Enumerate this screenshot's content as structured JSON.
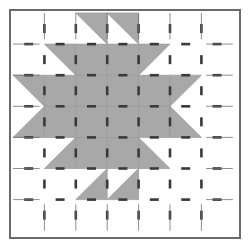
{
  "figure": {
    "title": "Quilt Block Pattern Diagram",
    "width": 250,
    "height": 248
  },
  "colors": {
    "background": "#ffffff",
    "patch_fill": "#a8a8a8",
    "patch_edge": "#9a9a9a",
    "frame_stroke": "#6b6b6b",
    "seam_dash": "#3a3a3a"
  },
  "grid": {
    "columns": 7,
    "rows": 7,
    "cell_width": 31.4,
    "cell_height": 31.1,
    "origin_x": 2,
    "origin_y": 2,
    "frame_inset": 9,
    "frame_border_width": 2
  },
  "seam_marks": {
    "dash_length": 9,
    "dash_thickness": 2.6,
    "note": "short dashed tick marks centered on each patch edge"
  },
  "patches": [
    {
      "row": 0,
      "col": 0,
      "shape": "empty"
    },
    {
      "row": 0,
      "col": 1,
      "shape": "empty"
    },
    {
      "row": 0,
      "col": 2,
      "shape": "triangle",
      "orient": "tr"
    },
    {
      "row": 0,
      "col": 3,
      "shape": "triangle",
      "orient": "tr"
    },
    {
      "row": 0,
      "col": 4,
      "shape": "empty"
    },
    {
      "row": 0,
      "col": 5,
      "shape": "empty"
    },
    {
      "row": 0,
      "col": 6,
      "shape": "empty"
    },
    {
      "row": 1,
      "col": 0,
      "shape": "empty"
    },
    {
      "row": 1,
      "col": 1,
      "shape": "triangle",
      "orient": "tr"
    },
    {
      "row": 1,
      "col": 2,
      "shape": "square"
    },
    {
      "row": 1,
      "col": 3,
      "shape": "square"
    },
    {
      "row": 1,
      "col": 4,
      "shape": "triangle",
      "orient": "tl"
    },
    {
      "row": 1,
      "col": 5,
      "shape": "empty"
    },
    {
      "row": 1,
      "col": 6,
      "shape": "empty"
    },
    {
      "row": 2,
      "col": 0,
      "shape": "triangle",
      "orient": "tr"
    },
    {
      "row": 2,
      "col": 1,
      "shape": "square"
    },
    {
      "row": 2,
      "col": 2,
      "shape": "square"
    },
    {
      "row": 2,
      "col": 3,
      "shape": "square"
    },
    {
      "row": 2,
      "col": 4,
      "shape": "square"
    },
    {
      "row": 2,
      "col": 5,
      "shape": "triangle",
      "orient": "tl"
    },
    {
      "row": 2,
      "col": 6,
      "shape": "empty"
    },
    {
      "row": 3,
      "col": 0,
      "shape": "triangle",
      "orient": "br"
    },
    {
      "row": 3,
      "col": 1,
      "shape": "square"
    },
    {
      "row": 3,
      "col": 2,
      "shape": "square"
    },
    {
      "row": 3,
      "col": 3,
      "shape": "square"
    },
    {
      "row": 3,
      "col": 4,
      "shape": "square"
    },
    {
      "row": 3,
      "col": 5,
      "shape": "triangle",
      "orient": "bl"
    },
    {
      "row": 3,
      "col": 6,
      "shape": "empty"
    },
    {
      "row": 4,
      "col": 0,
      "shape": "empty"
    },
    {
      "row": 4,
      "col": 1,
      "shape": "triangle",
      "orient": "br"
    },
    {
      "row": 4,
      "col": 2,
      "shape": "square"
    },
    {
      "row": 4,
      "col": 3,
      "shape": "square"
    },
    {
      "row": 4,
      "col": 4,
      "shape": "triangle",
      "orient": "bl"
    },
    {
      "row": 4,
      "col": 5,
      "shape": "empty"
    },
    {
      "row": 4,
      "col": 6,
      "shape": "empty"
    },
    {
      "row": 5,
      "col": 0,
      "shape": "empty"
    },
    {
      "row": 5,
      "col": 1,
      "shape": "empty"
    },
    {
      "row": 5,
      "col": 2,
      "shape": "triangle",
      "orient": "br"
    },
    {
      "row": 5,
      "col": 3,
      "shape": "triangle",
      "orient": "br"
    },
    {
      "row": 5,
      "col": 4,
      "shape": "empty"
    },
    {
      "row": 5,
      "col": 5,
      "shape": "empty"
    },
    {
      "row": 5,
      "col": 6,
      "shape": "empty"
    },
    {
      "row": 6,
      "col": 0,
      "shape": "empty"
    },
    {
      "row": 6,
      "col": 1,
      "shape": "empty"
    },
    {
      "row": 6,
      "col": 2,
      "shape": "empty"
    },
    {
      "row": 6,
      "col": 3,
      "shape": "empty"
    },
    {
      "row": 6,
      "col": 4,
      "shape": "empty"
    },
    {
      "row": 6,
      "col": 5,
      "shape": "empty"
    },
    {
      "row": 6,
      "col": 6,
      "shape": "empty"
    }
  ],
  "quadrant_blocks": [
    {
      "name": "top-left-block",
      "rows": [
        1,
        2
      ],
      "cols": [
        1,
        2
      ]
    },
    {
      "name": "top-right-block",
      "rows": [
        1,
        2
      ],
      "cols": [
        4,
        5
      ]
    },
    {
      "name": "bottom-left-block",
      "rows": [
        3,
        4
      ],
      "cols": [
        1,
        2
      ]
    },
    {
      "name": "bottom-right-block",
      "rows": [
        3,
        4
      ],
      "cols": [
        4,
        5
      ]
    }
  ],
  "center_patch": {
    "row": 3,
    "col": 3,
    "shape": "square",
    "label": "center square"
  }
}
